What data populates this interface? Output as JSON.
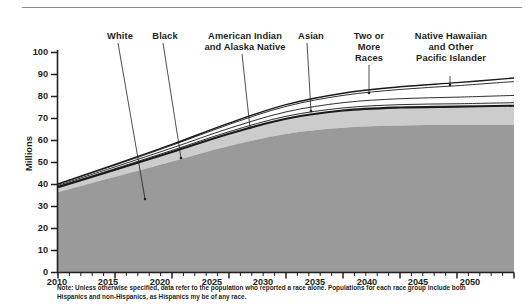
{
  "chart_data": {
    "type": "area",
    "title": "",
    "subtitle": "",
    "xlabel": "",
    "ylabel": "Millions",
    "xlim": [
      2010,
      2050
    ],
    "ylim": [
      0,
      100
    ],
    "grid": false,
    "legend_position": "callout-labels-above-plot",
    "stacked": true,
    "x": [
      2010,
      2015,
      2020,
      2025,
      2030,
      2035,
      2040,
      2045,
      2050
    ],
    "x_tick_labels": [
      "2010",
      "2015",
      "2020",
      "2025",
      "2030",
      "2035",
      "2040",
      "2045",
      "2050"
    ],
    "y_tick_labels": [
      "0",
      "10",
      "20",
      "30",
      "40",
      "50",
      "60",
      "70",
      "80",
      "90",
      "100"
    ],
    "series": [
      {
        "name": "White",
        "values": [
          36.5,
          43.5,
          50.5,
          57.5,
          63.0,
          65.8,
          66.8,
          67.0,
          67.2
        ]
      },
      {
        "name": "Black",
        "values": [
          2.2,
          3.2,
          4.3,
          5.6,
          6.9,
          7.8,
          8.2,
          8.4,
          8.6
        ]
      },
      {
        "name": "American Indian and Alaska Native",
        "values": [
          0.4,
          0.5,
          0.7,
          0.9,
          1.1,
          1.2,
          1.3,
          1.3,
          1.4
        ]
      },
      {
        "name": "Asian",
        "values": [
          0.5,
          0.8,
          1.1,
          1.5,
          2.0,
          2.4,
          2.7,
          3.0,
          3.3
        ]
      },
      {
        "name": "Two or More Races",
        "values": [
          0.5,
          0.8,
          1.2,
          1.8,
          2.5,
          3.3,
          4.2,
          5.2,
          6.3
        ]
      },
      {
        "name": "Native Hawaiian and Other Pacific Islander",
        "values": [
          0.2,
          0.3,
          0.4,
          0.6,
          0.8,
          1.0,
          1.2,
          1.4,
          1.6
        ]
      }
    ],
    "totals": [
      40.3,
      49.1,
      58.2,
      67.9,
      76.3,
      81.5,
      84.4,
      86.3,
      88.4
    ]
  },
  "axes": {
    "y_axis_title": "Millions",
    "y_ticks": [
      "100",
      "90",
      "80",
      "70",
      "60",
      "50",
      "40",
      "30",
      "20",
      "10",
      "0"
    ],
    "x_ticks": [
      "2010",
      "2015",
      "2020",
      "2025",
      "2030",
      "2035",
      "2040",
      "2045",
      "2050"
    ]
  },
  "callouts": [
    {
      "label": "White"
    },
    {
      "label": "Black"
    },
    {
      "label": "American Indian\nand Alaska Native"
    },
    {
      "label": "Asian"
    },
    {
      "label": "Two or\nMore\nRaces"
    },
    {
      "label": "Native Hawaiian\nand Other\nPacific Islander"
    }
  ],
  "note": {
    "text": "Note: Unless otherwise specified, data refer to the population who reported a race alone. Populations for each race group include both Hispanics and non-Hispanics, as Hispanics my be of any race."
  },
  "colors": {
    "area_primary": "#9a9a9a",
    "area_secondary": "#cccccc",
    "area_light": "#e9e9e9",
    "line": "#1a1a1a",
    "text": "#231f20",
    "rule": "#8c8c8c"
  }
}
